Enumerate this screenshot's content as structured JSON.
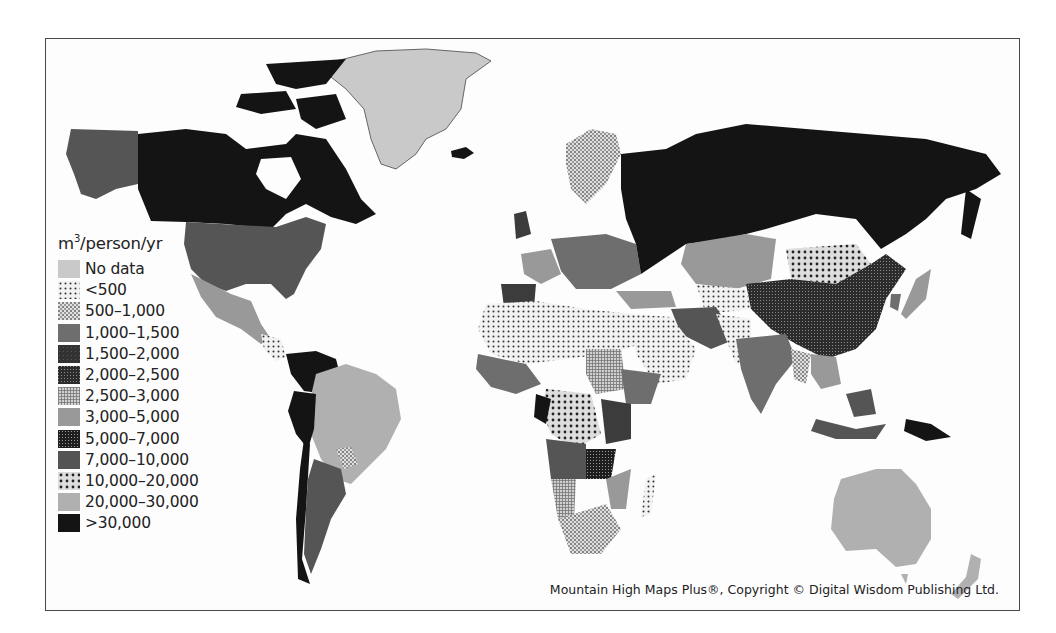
{
  "map": {
    "subject": "Renewable freshwater availability per person",
    "legend": {
      "title_base": "m",
      "title_sup": "3",
      "title_rest": "/person/yr",
      "items": [
        {
          "label": "No data",
          "fill": "#c9c9c9",
          "pattern": "solid"
        },
        {
          "label": "<500",
          "fill": "#f0f0f0",
          "pattern": "dots-small"
        },
        {
          "label": "500–1,000",
          "fill": "#e6e6e6",
          "pattern": "dots-dense"
        },
        {
          "label": "1,000–1,500",
          "fill": "#6e6e6e",
          "pattern": "solid"
        },
        {
          "label": "1,500–2,000",
          "fill": "#3c3c3c",
          "pattern": "solid-dark-texture"
        },
        {
          "label": "2,000–2,500",
          "fill": "#4a4a4a",
          "pattern": "grid-dark"
        },
        {
          "label": "2,500–3,000",
          "fill": "#bdbdbd",
          "pattern": "grid-light"
        },
        {
          "label": "3,000–5,000",
          "fill": "#999999",
          "pattern": "solid"
        },
        {
          "label": "5,000–7,000",
          "fill": "#5a5a5a",
          "pattern": "grid-fine"
        },
        {
          "label": "7,000–10,000",
          "fill": "#545454",
          "pattern": "solid"
        },
        {
          "label": "10,000–20,000",
          "fill": "#cfcfcf",
          "pattern": "dots-large"
        },
        {
          "label": "20,000–30,000",
          "fill": "#b0b0b0",
          "pattern": "solid"
        },
        {
          "label": ">30,000",
          "fill": "#141414",
          "pattern": "solid"
        }
      ]
    },
    "regions": [
      {
        "name": "Canada",
        "class": ">30,000"
      },
      {
        "name": "Alaska (USA)",
        "class": "7,000–10,000"
      },
      {
        "name": "Greenland",
        "class": "No data"
      },
      {
        "name": "United States",
        "class": "7,000–10,000"
      },
      {
        "name": "Mexico",
        "class": "3,000–5,000"
      },
      {
        "name": "Brazil",
        "class": "20,000–30,000"
      },
      {
        "name": "Argentina",
        "class": "7,000–10,000"
      },
      {
        "name": "Peru / Colombia / Chile",
        "class": ">30,000"
      },
      {
        "name": "Russia",
        "class": ">30,000"
      },
      {
        "name": "Kazakhstan",
        "class": "3,000–5,000"
      },
      {
        "name": "China",
        "class": "2,000–2,500"
      },
      {
        "name": "Mongolia",
        "class": "10,000–20,000"
      },
      {
        "name": "India",
        "class": "1,000–1,500"
      },
      {
        "name": "North Africa / Middle East",
        "class": "<500"
      },
      {
        "name": "Central Africa",
        "class": "10,000–20,000"
      },
      {
        "name": "Australia",
        "class": "20,000–30,000"
      },
      {
        "name": "Indonesia",
        "class": "7,000–10,000"
      },
      {
        "name": "Europe",
        "class": "3,000–5,000"
      }
    ],
    "credit": "Mountain High Maps Plus®, Copyright © Digital Wisdom Publishing Ltd."
  }
}
